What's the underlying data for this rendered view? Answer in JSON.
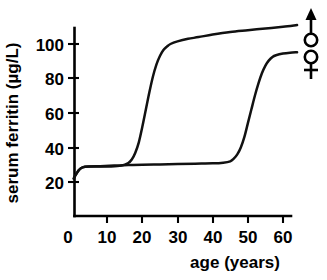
{
  "chart_data": {
    "type": "line",
    "title": "",
    "xlabel": "age (years)",
    "ylabel": "serum ferritin (µg/L)",
    "xlim": [
      0,
      65
    ],
    "ylim": [
      10,
      118
    ],
    "xticks": [
      "0",
      "10",
      "20",
      "30",
      "40",
      "50",
      "60"
    ],
    "xtick_values": [
      0,
      10,
      20,
      30,
      40,
      50,
      60
    ],
    "yticks": [
      "20",
      "40",
      "60",
      "80",
      "100"
    ],
    "ytick_values": [
      20,
      40,
      60,
      80,
      100
    ],
    "grid": false,
    "legend_position": "right-of-plot",
    "series": [
      {
        "name": "male",
        "symbol": "♂",
        "symbol_name": "mars-symbol",
        "x": [
          0.5,
          1,
          2,
          3,
          5,
          8,
          11,
          14,
          16,
          17,
          18,
          19,
          20,
          21,
          22,
          23,
          24,
          25,
          26,
          27,
          28,
          30,
          33,
          36,
          40,
          45,
          50,
          55,
          60,
          64
        ],
        "y": [
          22,
          24,
          27,
          28.5,
          29,
          29,
          29,
          29.5,
          31,
          33,
          37,
          43,
          52,
          62,
          72,
          81,
          88,
          93,
          96.5,
          98.5,
          100,
          101.5,
          103,
          104,
          105.5,
          107,
          108,
          109,
          110,
          111
        ]
      },
      {
        "name": "female",
        "symbol": "♀",
        "symbol_name": "venus-symbol",
        "x": [
          0.5,
          1,
          2,
          3,
          5,
          8,
          12,
          16,
          20,
          25,
          30,
          35,
          40,
          43,
          45,
          46,
          47,
          48,
          49,
          50,
          51,
          52,
          53,
          54,
          55,
          56,
          57,
          58,
          60,
          62,
          64
        ],
        "y": [
          22,
          24,
          27,
          28.5,
          29,
          29.2,
          29.5,
          29.8,
          30,
          30.2,
          30.4,
          30.6,
          30.8,
          31.2,
          32,
          33.5,
          36,
          40,
          46,
          54,
          62,
          70,
          77,
          83,
          87.5,
          90.5,
          92.5,
          93.5,
          94.5,
          95,
          95.2
        ]
      }
    ]
  }
}
